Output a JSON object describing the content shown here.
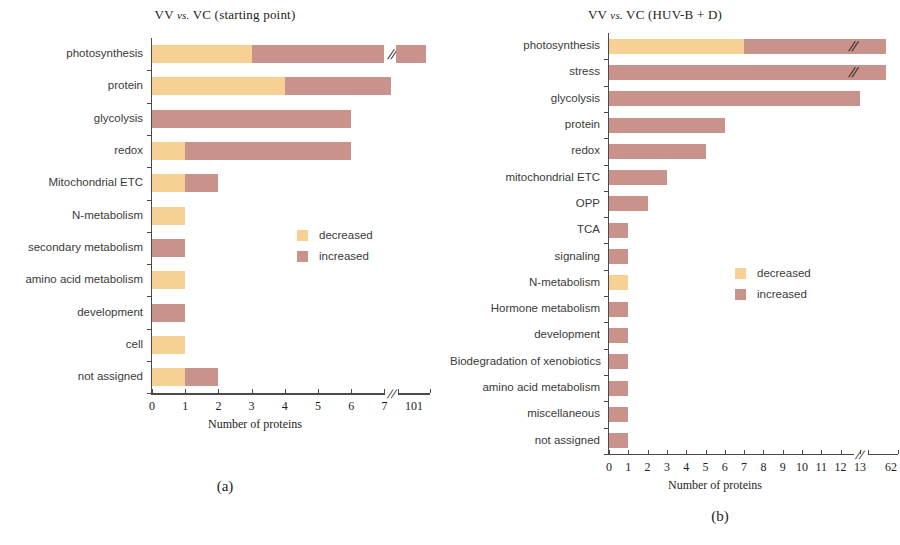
{
  "figure": {
    "legend": {
      "decreased_label": "decreased",
      "increased_label": "increased",
      "decreased_color": "#f7d194",
      "increased_color": "#c9938c"
    },
    "panel_a_letter": "(a)",
    "panel_b_letter": "(b)"
  },
  "chart_data": [
    {
      "type": "bar",
      "orientation": "horizontal",
      "stacked": true,
      "panel": "(a)",
      "title": "VV vs. VC  (starting point)",
      "title_prefix": "VV",
      "title_vs": "vs.",
      "title_suffix": "VC  (starting point)",
      "xlabel": "Number of proteins",
      "ylabel": "",
      "xlim": [
        0,
        7
      ],
      "xticks": [
        0,
        1,
        2,
        3,
        4,
        5,
        6,
        7
      ],
      "xticklabels": [
        "0",
        "1",
        "2",
        "3",
        "4",
        "5",
        "6",
        "7"
      ],
      "axis_break": true,
      "break_tick_label": "101",
      "grid": false,
      "legend_position": "center-right",
      "categories": [
        "photosynthesis",
        "protein",
        "glycolysis",
        "redox",
        "Mitochondrial ETC",
        "N-metabolism",
        "secondary metabolism",
        "amino acid metabolism",
        "development",
        "cell",
        "not assigned"
      ],
      "series": [
        {
          "name": "decreased",
          "color": "#f7d194",
          "values": [
            3,
            4,
            0,
            1,
            1,
            1,
            0,
            1,
            0,
            1,
            1
          ]
        },
        {
          "name": "increased",
          "color": "#c9938c",
          "values": [
            4,
            3.2,
            6,
            5,
            1,
            0,
            1,
            0,
            1,
            0,
            1
          ]
        }
      ],
      "broken_bars": [
        {
          "category": "photosynthesis",
          "series": "increased",
          "value": 101,
          "note": "bar continues past axis break to 101"
        }
      ]
    },
    {
      "type": "bar",
      "orientation": "horizontal",
      "stacked": true,
      "panel": "(b)",
      "title": "VV vs. VC (HUV-B + D)",
      "title_prefix": "VV",
      "title_vs": "vs.",
      "title_suffix": "VC (HUV-B + D)",
      "xlabel": "Number of proteins",
      "ylabel": "",
      "xlim": [
        0,
        13
      ],
      "xticks": [
        0,
        1,
        2,
        3,
        4,
        5,
        6,
        7,
        8,
        9,
        10,
        11,
        12,
        13
      ],
      "xticklabels": [
        "0",
        "1",
        "2",
        "3",
        "4",
        "5",
        "6",
        "7",
        "8",
        "9",
        "10",
        "11",
        "12",
        "13"
      ],
      "axis_break": true,
      "break_tick_label": "62",
      "grid": false,
      "legend_position": "center-right",
      "categories": [
        "photosynthesis",
        "stress",
        "glycolysis",
        "protein",
        "redox",
        "mitochondrial  ETC",
        "OPP",
        "TCA",
        "signaling",
        "N-metabolism",
        "Hormone metabolism",
        "development",
        "Biodegradation of xenobiotics",
        "amino acid metabolism",
        "miscellaneous",
        "not assigned"
      ],
      "series": [
        {
          "name": "decreased",
          "color": "#f7d194",
          "values": [
            7,
            0,
            0,
            0,
            0,
            0,
            0,
            0,
            0,
            1,
            0,
            0,
            0,
            0,
            0,
            0
          ]
        },
        {
          "name": "increased",
          "color": "#c9938c",
          "values": [
            6.9,
            13.9,
            13,
            6,
            5,
            3,
            2,
            1,
            1,
            0,
            1,
            1,
            1,
            1,
            1,
            1
          ]
        }
      ],
      "broken_bars": [
        {
          "category": "photosynthesis",
          "series": "increased",
          "value": 62,
          "note": "bar continues past axis break to 62"
        },
        {
          "category": "stress",
          "series": "increased",
          "value": 62,
          "note": "bar continues past axis break to 62"
        }
      ]
    }
  ]
}
